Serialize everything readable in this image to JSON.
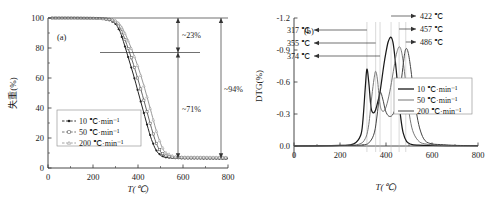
{
  "figure": {
    "panel_a_label": "(a)",
    "panel_b_label": "(b)"
  },
  "chart_data": [
    {
      "type": "line",
      "panel": "(a)",
      "title": "",
      "xlabel": "T(℃)",
      "ylabel": "失重(%)",
      "xlim": [
        0,
        800
      ],
      "ylim": [
        0,
        100
      ],
      "xticks": [
        0,
        200,
        400,
        600,
        800
      ],
      "yticks": [
        0,
        20,
        40,
        60,
        80,
        100
      ],
      "grid": false,
      "legend_position": "lower-left",
      "series": [
        {
          "name": "10 ℃·min⁻¹",
          "marker": "filled-circle",
          "x": [
            0,
            100,
            200,
            250,
            280,
            300,
            320,
            340,
            360,
            380,
            400,
            420,
            440,
            460,
            480,
            500,
            520,
            560,
            600,
            700,
            800
          ],
          "values": [
            100,
            100,
            99.7,
            99.2,
            98.2,
            96.0,
            91.0,
            82.0,
            72.0,
            62.0,
            51.0,
            40.0,
            29.0,
            19.0,
            12.0,
            8.5,
            7.2,
            6.6,
            6.4,
            6.3,
            6.2
          ]
        },
        {
          "name": "50 ℃·min⁻¹",
          "marker": "open-square",
          "x": [
            0,
            100,
            200,
            250,
            280,
            300,
            320,
            340,
            360,
            380,
            400,
            420,
            440,
            460,
            480,
            500,
            520,
            560,
            600,
            700,
            800
          ],
          "values": [
            100,
            100,
            99.8,
            99.5,
            98.8,
            97.3,
            93.5,
            86.5,
            78.0,
            69.0,
            59.0,
            48.5,
            37.5,
            26.5,
            17.0,
            11.0,
            8.2,
            7.0,
            6.8,
            6.7,
            6.6
          ]
        },
        {
          "name": "200 ℃·min⁻¹",
          "marker": "open-triangle",
          "x": [
            0,
            100,
            200,
            250,
            280,
            300,
            320,
            340,
            360,
            380,
            400,
            420,
            440,
            460,
            480,
            500,
            520,
            560,
            600,
            700,
            800
          ],
          "values": [
            100,
            100,
            99.9,
            99.7,
            99.2,
            98.3,
            95.8,
            90.5,
            83.5,
            76.0,
            67.5,
            58.0,
            47.5,
            36.5,
            25.5,
            16.5,
            10.5,
            7.6,
            7.3,
            7.2,
            7.1
          ]
        }
      ],
      "annotations": [
        {
          "label": "~23%",
          "from_y": 100,
          "to_y": 77
        },
        {
          "label": "~71%",
          "from_y": 77,
          "to_y": 6.5
        },
        {
          "label": "~94%",
          "from_y": 100,
          "to_y": 6.5
        }
      ]
    },
    {
      "type": "line",
      "panel": "(b)",
      "title": "",
      "xlabel": "T(℃)",
      "ylabel": "DTG(%)",
      "xlim": [
        0,
        800
      ],
      "ylim": [
        0.0,
        -1.2
      ],
      "xticks": [
        0,
        200,
        400,
        600,
        800
      ],
      "yticks": [
        0.0,
        -0.3,
        -0.6,
        -0.9,
        -1.2
      ],
      "grid": false,
      "legend_position": "right",
      "series": [
        {
          "name": "10 ℃·min⁻¹",
          "peaks": [
            {
              "T": 317,
              "DTG": -0.72
            },
            {
              "T": 422,
              "DTG": -1.02
            }
          ],
          "x": [
            0,
            200,
            260,
            290,
            300,
            310,
            317,
            325,
            335,
            345,
            355,
            365,
            375,
            390,
            400,
            410,
            422,
            432,
            445,
            455,
            465,
            475,
            490,
            510,
            540,
            600,
            700,
            800
          ],
          "values": [
            0,
            -0.005,
            -0.02,
            -0.1,
            -0.25,
            -0.55,
            -0.72,
            -0.6,
            -0.36,
            -0.31,
            -0.34,
            -0.42,
            -0.52,
            -0.75,
            -0.88,
            -0.98,
            -1.02,
            -0.95,
            -0.7,
            -0.45,
            -0.25,
            -0.12,
            -0.04,
            -0.015,
            -0.008,
            -0.005,
            -0.004,
            -0.003
          ]
        },
        {
          "name": "50 ℃·min⁻¹",
          "peaks": [
            {
              "T": 355,
              "DTG": -0.7
            },
            {
              "T": 457,
              "DTG": -0.93
            }
          ],
          "x": [
            0,
            200,
            280,
            310,
            325,
            338,
            348,
            355,
            363,
            372,
            380,
            392,
            405,
            420,
            435,
            445,
            457,
            468,
            480,
            492,
            505,
            520,
            545,
            575,
            620,
            700,
            800
          ],
          "values": [
            0,
            -0.005,
            -0.015,
            -0.07,
            -0.2,
            -0.46,
            -0.63,
            -0.7,
            -0.62,
            -0.42,
            -0.34,
            -0.33,
            -0.4,
            -0.55,
            -0.74,
            -0.86,
            -0.93,
            -0.88,
            -0.7,
            -0.46,
            -0.25,
            -0.12,
            -0.04,
            -0.018,
            -0.008,
            -0.005,
            -0.003
          ]
        },
        {
          "name": "200 ℃·min⁻¹",
          "peaks": [
            {
              "T": 374,
              "DTG": -0.5
            },
            {
              "T": 486,
              "DTG": -0.91
            }
          ],
          "x": [
            0,
            200,
            300,
            330,
            350,
            362,
            374,
            386,
            398,
            412,
            428,
            442,
            456,
            468,
            478,
            486,
            496,
            508,
            520,
            535,
            550,
            570,
            600,
            650,
            700,
            800
          ],
          "values": [
            0,
            -0.004,
            -0.01,
            -0.04,
            -0.13,
            -0.3,
            -0.5,
            -0.44,
            -0.33,
            -0.28,
            -0.29,
            -0.36,
            -0.47,
            -0.64,
            -0.82,
            -0.91,
            -0.88,
            -0.72,
            -0.5,
            -0.28,
            -0.14,
            -0.05,
            -0.02,
            -0.012,
            -0.006,
            -0.003
          ]
        }
      ],
      "annotations_left": [
        {
          "label": "317 ℃",
          "T": 317
        },
        {
          "label": "355 ℃",
          "T": 355
        },
        {
          "label": "374 ℃",
          "T": 374
        }
      ],
      "annotations_right": [
        {
          "label": "422 ℃",
          "T": 422
        },
        {
          "label": "457 ℃",
          "T": 457
        },
        {
          "label": "486 ℃",
          "T": 486
        }
      ]
    }
  ]
}
